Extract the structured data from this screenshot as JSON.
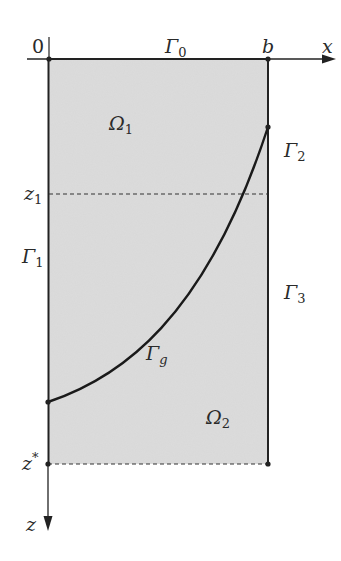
{
  "diagram": {
    "title": "",
    "colors": {
      "fill": "#dcdcdc",
      "line": "#222222",
      "text": "#2a2a2a",
      "background": "#ffffff"
    },
    "axes": {
      "x_label": "x",
      "z_label": "z",
      "origin_label": "0",
      "b_label": "b",
      "z1_label": "z",
      "z1_sub": "1",
      "zstar_label": "z",
      "zstar_sup": "*"
    },
    "boundaries": {
      "gamma0": {
        "symbol": "Γ",
        "sub": "0"
      },
      "gamma1": {
        "symbol": "Γ",
        "sub": "1"
      },
      "gamma2": {
        "symbol": "Γ",
        "sub": "2"
      },
      "gamma3": {
        "symbol": "Γ",
        "sub": "3"
      },
      "gammag": {
        "symbol": "Γ",
        "sub": "g"
      }
    },
    "regions": {
      "omega1": {
        "symbol": "Ω",
        "sub": "1"
      },
      "omega2": {
        "symbol": "Ω",
        "sub": "2"
      }
    }
  }
}
